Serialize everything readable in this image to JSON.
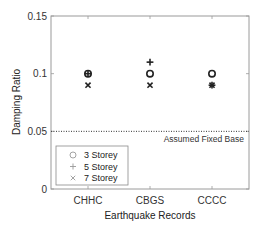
{
  "chart_data": {
    "type": "scatter",
    "title": "",
    "xlabel": "Earthquake Records",
    "ylabel": "Damping Ratio",
    "categories": [
      "CHHC",
      "CBGS",
      "CCCC"
    ],
    "ylim": [
      0,
      0.15
    ],
    "yticks": [
      0,
      0.05,
      0.1,
      0.15
    ],
    "ytick_labels": [
      "0",
      "0.05",
      "0.1",
      "0.15"
    ],
    "grid": false,
    "legend_position": "lower left",
    "series": [
      {
        "name": "3 Storey",
        "marker": "circle",
        "values": [
          0.1,
          0.1,
          0.1
        ]
      },
      {
        "name": "5 Storey",
        "marker": "plus",
        "values": [
          0.1,
          0.11,
          0.09
        ]
      },
      {
        "name": "7 Storey",
        "marker": "x",
        "values": [
          0.09,
          0.09,
          0.09
        ]
      }
    ],
    "reference_lines": [
      {
        "y": 0.05,
        "style": "dotted",
        "label": "Assumed Fixed Base"
      }
    ]
  }
}
